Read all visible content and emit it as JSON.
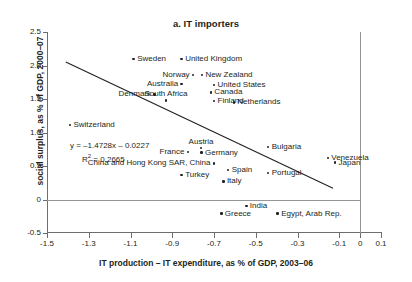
{
  "chart_data": {
    "type": "scatter",
    "title": "a. IT importers",
    "xlabel": "IT production – IT expenditure, as % of GDP, 2003–06",
    "ylabel": "social surplus, as % of GDP, 2000–07",
    "xlim": [
      -1.5,
      0.1
    ],
    "ylim": [
      -0.5,
      2.5
    ],
    "xticks": [
      "-1.5",
      "-1.3",
      "-1.1",
      "-0.9",
      "-0.7",
      "-0.5",
      "-0.3",
      "-0.1",
      "0",
      "0.1"
    ],
    "xtick_values": [
      -1.5,
      -1.3,
      -1.1,
      -0.9,
      -0.7,
      -0.5,
      -0.3,
      -0.1,
      0,
      0.1
    ],
    "yticks": [
      "2.5",
      "2.0",
      "1.5",
      "1.0",
      "0.5",
      "0",
      "-0.5"
    ],
    "ytick_values": [
      2.5,
      2.0,
      1.5,
      1.0,
      0.5,
      0,
      -0.5
    ],
    "grid": false,
    "legend": "none",
    "annotations": {
      "equation": "y = –1.4728x – 0.0227",
      "r_squared_label": "R",
      "r_squared_sup": "2",
      "r_squared_value": "= 0.2665",
      "r_squared_full": "R² = 0.2665"
    },
    "trendline": {
      "slope": -1.4728,
      "intercept": -0.0227,
      "r_squared": 0.2665,
      "x_start": -1.41,
      "x_end": -0.13
    },
    "points": [
      {
        "name": "Sweden",
        "x": -1.085,
        "y": 2.1,
        "label_pos": "l"
      },
      {
        "name": "United Kingdom",
        "x": -0.855,
        "y": 2.1,
        "label_pos": "l"
      },
      {
        "name": "Norway",
        "x": -0.8,
        "y": 1.86,
        "label_pos": "r"
      },
      {
        "name": "New Zealand",
        "x": -0.758,
        "y": 1.86,
        "label_pos": "l"
      },
      {
        "name": "Australia",
        "x": -0.855,
        "y": 1.72,
        "label_pos": "r"
      },
      {
        "name": "United States",
        "x": -0.7,
        "y": 1.71,
        "label_pos": "l"
      },
      {
        "name": "Denmark",
        "x": -0.985,
        "y": 1.57,
        "label_pos": "r"
      },
      {
        "name": "Canada",
        "x": -0.715,
        "y": 1.6,
        "label_pos": "l"
      },
      {
        "name": "South Africa",
        "x": -0.93,
        "y": 1.48,
        "label_pos": "c"
      },
      {
        "name": "Finland",
        "x": -0.7,
        "y": 1.47,
        "label_pos": "l"
      },
      {
        "name": "Netherlands",
        "x": -0.605,
        "y": 1.45,
        "label_pos": "l"
      },
      {
        "name": "Switzerland",
        "x": -1.39,
        "y": 1.11,
        "label_pos": "l"
      },
      {
        "name": "Austria",
        "x": -0.762,
        "y": 0.77,
        "label_pos": "c"
      },
      {
        "name": "France",
        "x": -0.825,
        "y": 0.71,
        "label_pos": "r"
      },
      {
        "name": "Germany",
        "x": -0.76,
        "y": 0.7,
        "label_pos": "l"
      },
      {
        "name": "Bulgaria",
        "x": -0.44,
        "y": 0.78,
        "label_pos": "l"
      },
      {
        "name": "Venezuela",
        "x": -0.155,
        "y": 0.62,
        "label_pos": "l"
      },
      {
        "name": "Japan",
        "x": -0.12,
        "y": 0.55,
        "label_pos": "l"
      },
      {
        "name": "China and Hong Kong SAR, China",
        "x": -0.7,
        "y": 0.54,
        "label_pos": "r"
      },
      {
        "name": "Spain",
        "x": -0.632,
        "y": 0.44,
        "label_pos": "l"
      },
      {
        "name": "Turkey",
        "x": -0.855,
        "y": 0.37,
        "label_pos": "l"
      },
      {
        "name": "Portugal",
        "x": -0.44,
        "y": 0.4,
        "label_pos": "l"
      },
      {
        "name": "Italy",
        "x": -0.655,
        "y": 0.27,
        "label_pos": "l"
      },
      {
        "name": "India",
        "x": -0.545,
        "y": -0.1,
        "label_pos": "l"
      },
      {
        "name": "Greece",
        "x": -0.665,
        "y": -0.21,
        "label_pos": "l"
      },
      {
        "name": "Egypt, Arab Rep.",
        "x": -0.395,
        "y": -0.21,
        "label_pos": "l"
      }
    ]
  }
}
